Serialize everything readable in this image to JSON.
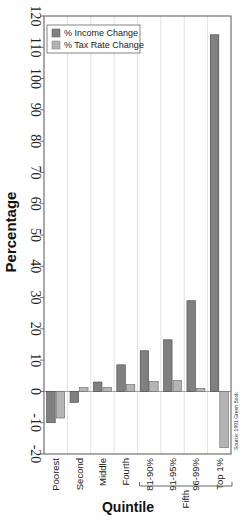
{
  "chart_data": {
    "type": "bar",
    "title": "",
    "xlabel": "Quintile",
    "ylabel": "Percentage",
    "ylim": [
      -20,
      120
    ],
    "yticks": [
      -20,
      -10,
      0,
      10,
      20,
      30,
      40,
      50,
      60,
      70,
      80,
      90,
      100,
      110,
      120
    ],
    "grid": true,
    "legend_position": "upper-left",
    "categories": [
      "Poorest",
      "Second",
      "Middle",
      "Fourth",
      "81-90%",
      "91-95%",
      "96-99%",
      "Top 1%"
    ],
    "category_group": {
      "label": "Fifth",
      "members": [
        "81-90%",
        "91-95%",
        "96-99%",
        "Top 1%"
      ]
    },
    "series": [
      {
        "name": "% Income Change",
        "color": "#808080",
        "values": [
          -10,
          -3.5,
          3,
          8.5,
          13,
          16.5,
          29,
          114
        ]
      },
      {
        "name": "% Tax Rate Change",
        "color": "#b4b4b4",
        "values": [
          -8.5,
          1.2,
          1.3,
          2.2,
          3.2,
          3.5,
          1,
          -18
        ]
      }
    ],
    "annotation": "Source: 1991 Green Book"
  }
}
